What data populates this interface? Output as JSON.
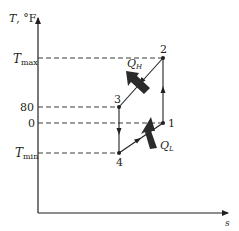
{
  "diagram": {
    "type": "T-s diagram (refrigeration cycle)",
    "y_axis_label": "T, °F",
    "y_axis_var": "T",
    "y_axis_unit": ", °F",
    "x_axis_label": "s",
    "ticks": [
      {
        "id": "tmax",
        "main": "T",
        "sub": "max"
      },
      {
        "id": "t80",
        "text": "80"
      },
      {
        "id": "t0",
        "text": "0"
      },
      {
        "id": "tmin",
        "main": "T",
        "sub": "min"
      }
    ],
    "states": [
      {
        "id": "1",
        "label": "1"
      },
      {
        "id": "2",
        "label": "2"
      },
      {
        "id": "3",
        "label": "3"
      },
      {
        "id": "4",
        "label": "4"
      }
    ],
    "processes": [
      {
        "from": "1",
        "to": "2",
        "description": "isentropic compression"
      },
      {
        "from": "2",
        "to": "3",
        "description": "heat rejection"
      },
      {
        "from": "3",
        "to": "4",
        "description": "isentropic expansion"
      },
      {
        "from": "4",
        "to": "1",
        "description": "heat absorption"
      }
    ],
    "heat_labels": {
      "q_h": {
        "main": "Q",
        "sub": "H"
      },
      "q_l": {
        "main": "Q",
        "sub": "L"
      }
    },
    "colors": {
      "ink": "#231f20",
      "dash": "#3a3a3a",
      "heat_arrow": "#2b2b2b"
    }
  }
}
